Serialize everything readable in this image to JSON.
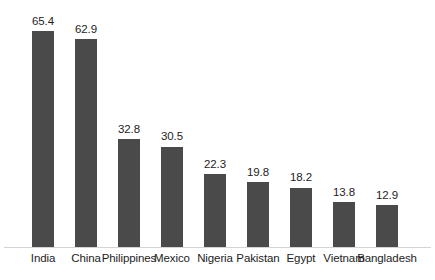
{
  "chart_data": {
    "type": "bar",
    "title": "",
    "subtitle": "",
    "xlabel": "",
    "ylabel": "",
    "categories": [
      "India",
      "China",
      "Philippines",
      "Mexico",
      "Nigeria",
      "Pakistan",
      "Egypt",
      "Vietnam",
      "Bangladesh"
    ],
    "values": [
      65.4,
      62.9,
      32.8,
      30.5,
      22.3,
      19.8,
      18.2,
      13.8,
      12.9
    ],
    "value_labels": [
      "65.4",
      "62.9",
      "32.8",
      "30.5",
      "22.3",
      "19.8",
      "18.2",
      "13.8",
      "12.9"
    ],
    "ylim": [
      0,
      70
    ],
    "grid": false,
    "legend": false,
    "legend_position": "none",
    "data_labels_shown": true,
    "axis_line_color": "#d4d4d4",
    "bar_color": "#4a4a4a",
    "background_color": "#ffffff",
    "text_color": "#1d1d1d"
  }
}
